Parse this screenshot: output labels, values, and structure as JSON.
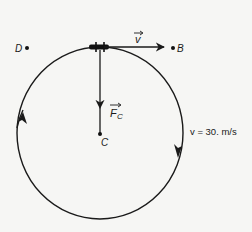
{
  "diagram": {
    "colors": {
      "background": "#f6f6f4",
      "ink": "#1a1a1a"
    },
    "circle": {
      "center": {
        "x": 100,
        "y": 133
      },
      "rx": 83,
      "ry": 86,
      "direction": "clockwise"
    },
    "points": [
      {
        "id": "D",
        "label": "D",
        "x": 30,
        "y": 48
      },
      {
        "id": "B",
        "label": "B",
        "x": 173,
        "y": 48
      },
      {
        "id": "C",
        "label": "C",
        "x": 100,
        "y": 134
      }
    ],
    "object": {
      "name": "mass on circle (top)",
      "x": 100,
      "y": 47
    },
    "vectors": {
      "velocity": {
        "symbol": "v",
        "has_arrow_over": true,
        "from": {
          "x": 100,
          "y": 47
        },
        "to": {
          "x": 163,
          "y": 47
        }
      },
      "centripetal_force": {
        "symbol": "F",
        "subscript": "C",
        "has_arrow_over": true,
        "from": {
          "x": 100,
          "y": 47
        },
        "to": {
          "x": 100,
          "y": 108
        }
      }
    },
    "speed_label": "v = 30. m/s"
  }
}
